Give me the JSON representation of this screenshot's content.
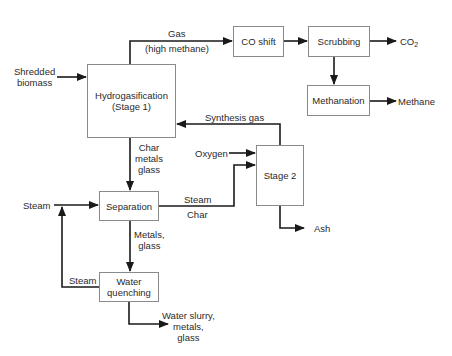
{
  "diagram": {
    "type": "process-flow",
    "colors": {
      "line": "#1a1a1a",
      "box_border": "#8a8a8a",
      "text": "#2a2a2a",
      "background": "#ffffff"
    },
    "boxes": {
      "hydrogasification": {
        "line1": "Hydrogasification",
        "line2": "(Stage 1)"
      },
      "co_shift": {
        "label": "CO shift"
      },
      "scrubbing": {
        "label": "Scrubbing"
      },
      "methanation": {
        "label": "Methanation"
      },
      "stage2": {
        "label": "Stage 2"
      },
      "separation": {
        "label": "Separation"
      },
      "water_quenching": {
        "line1": "Water",
        "line2": "quenching"
      }
    },
    "labels": {
      "shredded_biomass": {
        "line1": "Shredded",
        "line2": "biomass"
      },
      "gas": {
        "line1": "Gas",
        "line2": "(high methane)"
      },
      "co2": {
        "main": "CO",
        "sub": "2"
      },
      "methane": "Methane",
      "synthesis_gas": "Synthesis gas",
      "oxygen": "Oxygen",
      "char_metals_glass": {
        "line1": "Char",
        "line2": "metals",
        "line3": "glass"
      },
      "steam_in": "Steam",
      "steam_char": {
        "steam": "Steam",
        "char": "Char"
      },
      "ash": "Ash",
      "metals_glass": {
        "line1": "Metals,",
        "line2": "glass"
      },
      "steam_recycle": "Steam",
      "water_slurry": {
        "line1": "Water slurry,",
        "line2": "metals,",
        "line3": "glass"
      }
    },
    "flows": [
      {
        "from": "Shredded biomass",
        "to": "Hydrogasification (Stage 1)"
      },
      {
        "from": "Hydrogasification (Stage 1)",
        "to": "CO shift",
        "label": "Gas (high methane)"
      },
      {
        "from": "CO shift",
        "to": "Scrubbing"
      },
      {
        "from": "Scrubbing",
        "to": "CO2"
      },
      {
        "from": "Scrubbing",
        "to": "Methanation"
      },
      {
        "from": "Methanation",
        "to": "Methane"
      },
      {
        "from": "Stage 2",
        "to": "Hydrogasification (Stage 1)",
        "label": "Synthesis gas"
      },
      {
        "from": "Hydrogasification (Stage 1)",
        "to": "Separation",
        "label": "Char metals glass"
      },
      {
        "from": "Oxygen",
        "to": "Stage 2"
      },
      {
        "from": "Separation",
        "to": "Stage 2",
        "label": "Steam / Char"
      },
      {
        "from": "Stage 2",
        "to": "Ash"
      },
      {
        "from": "Steam",
        "to": "Separation"
      },
      {
        "from": "Separation",
        "to": "Water quenching",
        "label": "Metals, glass"
      },
      {
        "from": "Water quenching",
        "to": "Separation",
        "label": "Steam"
      },
      {
        "from": "Water quenching",
        "to": "Water slurry, metals, glass"
      }
    ]
  }
}
